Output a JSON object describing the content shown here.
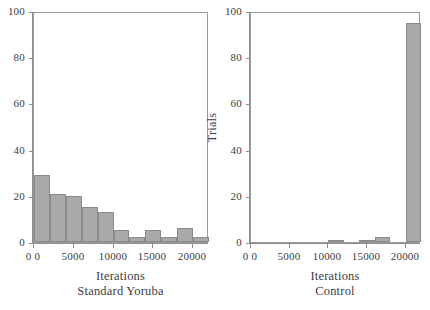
{
  "chart_data": [
    {
      "type": "bar",
      "title": "",
      "xlabel": "Iterations",
      "sublabel": "Standard Yoruba",
      "ylabel": "Trials",
      "xlim": [
        0,
        22000
      ],
      "ylim": [
        0,
        100
      ],
      "grid": false,
      "legend": "none",
      "bin_width": 2000,
      "bar_color": "#a9a9a9",
      "bar_edge_color": "#8a8a8a",
      "xticks": [
        0,
        5000,
        10000,
        15000,
        20000
      ],
      "xtick_labels": [
        "0 0",
        "5000",
        "10000",
        "15000",
        "20000"
      ],
      "yticks": [
        0,
        20,
        40,
        60,
        80,
        100
      ],
      "ytick_labels": [
        "0",
        "20",
        "40",
        "60",
        "80",
        "100"
      ],
      "bins": [
        {
          "x0": 0,
          "x1": 2000,
          "value": 29
        },
        {
          "x0": 2000,
          "x1": 4000,
          "value": 21
        },
        {
          "x0": 4000,
          "x1": 6000,
          "value": 20
        },
        {
          "x0": 6000,
          "x1": 8000,
          "value": 15
        },
        {
          "x0": 8000,
          "x1": 10000,
          "value": 13
        },
        {
          "x0": 10000,
          "x1": 12000,
          "value": 5
        },
        {
          "x0": 12000,
          "x1": 14000,
          "value": 2
        },
        {
          "x0": 14000,
          "x1": 16000,
          "value": 5
        },
        {
          "x0": 16000,
          "x1": 18000,
          "value": 2
        },
        {
          "x0": 18000,
          "x1": 20000,
          "value": 6
        },
        {
          "x0": 20000,
          "x1": 22000,
          "value": 2
        }
      ]
    },
    {
      "type": "bar",
      "title": "",
      "xlabel": "Iterations",
      "sublabel": "Control",
      "ylabel": "Trials",
      "xlim": [
        0,
        22000
      ],
      "ylim": [
        0,
        100
      ],
      "grid": false,
      "legend": "none",
      "bin_width": 2000,
      "bar_color": "#a9a9a9",
      "bar_edge_color": "#8a8a8a",
      "xticks": [
        0,
        5000,
        10000,
        15000,
        20000
      ],
      "xtick_labels": [
        "0 0",
        "5000",
        "10000",
        "15000",
        "20000"
      ],
      "yticks": [
        0,
        20,
        40,
        60,
        80,
        100
      ],
      "ytick_labels": [
        "0",
        "20",
        "40",
        "60",
        "80",
        "100"
      ],
      "bins": [
        {
          "x0": 0,
          "x1": 2000,
          "value": 0
        },
        {
          "x0": 2000,
          "x1": 4000,
          "value": 0
        },
        {
          "x0": 4000,
          "x1": 6000,
          "value": 0
        },
        {
          "x0": 6000,
          "x1": 8000,
          "value": 0
        },
        {
          "x0": 8000,
          "x1": 10000,
          "value": 0
        },
        {
          "x0": 10000,
          "x1": 12000,
          "value": 1
        },
        {
          "x0": 12000,
          "x1": 14000,
          "value": 0
        },
        {
          "x0": 14000,
          "x1": 16000,
          "value": 1
        },
        {
          "x0": 16000,
          "x1": 18000,
          "value": 2
        },
        {
          "x0": 18000,
          "x1": 20000,
          "value": 0
        },
        {
          "x0": 20000,
          "x1": 22000,
          "value": 95
        }
      ]
    }
  ]
}
